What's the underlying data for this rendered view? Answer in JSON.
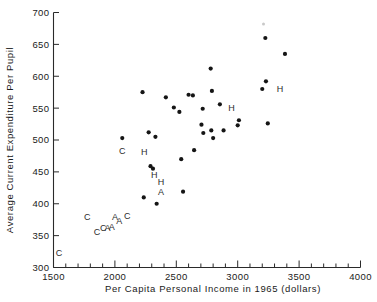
{
  "chart_data": {
    "type": "scatter",
    "title": "",
    "xlabel": "Per Capita Personal Income in 1965 (dollars)",
    "ylabel": "Average Current Expenditure Per Pupil",
    "xlim": [
      1500,
      4000
    ],
    "ylim": [
      300,
      700
    ],
    "xticks": [
      1500,
      2000,
      2500,
      3000,
      3500,
      4000
    ],
    "xtick_labels": [
      "1500",
      "2000",
      "2500",
      "3000",
      "3500",
      "4000"
    ],
    "xminor_step": 100,
    "yticks": [
      300,
      350,
      400,
      450,
      500,
      550,
      600,
      650,
      700
    ],
    "ytick_labels": [
      "300",
      "350",
      "400",
      "450",
      "500",
      "550",
      "600",
      "650",
      "700"
    ],
    "grid": false,
    "legend": "none",
    "marker": "filled-circle",
    "marker_color": "#151515",
    "points": [
      {
        "x": 2060,
        "y": 503
      },
      {
        "x": 2225,
        "y": 575
      },
      {
        "x": 2275,
        "y": 512
      },
      {
        "x": 2290,
        "y": 459
      },
      {
        "x": 2310,
        "y": 455
      },
      {
        "x": 2330,
        "y": 505
      },
      {
        "x": 2235,
        "y": 410
      },
      {
        "x": 2340,
        "y": 400
      },
      {
        "x": 2415,
        "y": 567
      },
      {
        "x": 2480,
        "y": 551
      },
      {
        "x": 2525,
        "y": 544
      },
      {
        "x": 2540,
        "y": 470
      },
      {
        "x": 2555,
        "y": 419
      },
      {
        "x": 2600,
        "y": 571
      },
      {
        "x": 2635,
        "y": 570
      },
      {
        "x": 2645,
        "y": 484
      },
      {
        "x": 2705,
        "y": 524
      },
      {
        "x": 2715,
        "y": 549
      },
      {
        "x": 2720,
        "y": 511
      },
      {
        "x": 2780,
        "y": 612
      },
      {
        "x": 2790,
        "y": 577
      },
      {
        "x": 2785,
        "y": 515
      },
      {
        "x": 2800,
        "y": 503
      },
      {
        "x": 2855,
        "y": 556
      },
      {
        "x": 2885,
        "y": 515
      },
      {
        "x": 3000,
        "y": 523
      },
      {
        "x": 3010,
        "y": 531
      },
      {
        "x": 3200,
        "y": 580
      },
      {
        "x": 3225,
        "y": 660
      },
      {
        "x": 3230,
        "y": 592
      },
      {
        "x": 3245,
        "y": 526
      },
      {
        "x": 3385,
        "y": 635
      }
    ],
    "smudge": {
      "x": 3210,
      "y": 682
    },
    "letter_labels": [
      {
        "text": "C",
        "x": 1545,
        "y": 318
      },
      {
        "text": "C",
        "x": 1775,
        "y": 375
      },
      {
        "text": "C",
        "x": 1855,
        "y": 351
      },
      {
        "text": "C",
        "x": 1905,
        "y": 357
      },
      {
        "text": "A",
        "x": 1940,
        "y": 358
      },
      {
        "text": "A",
        "x": 1975,
        "y": 359
      },
      {
        "text": "A",
        "x": 2000,
        "y": 375
      },
      {
        "text": "A",
        "x": 2035,
        "y": 369
      },
      {
        "text": "C",
        "x": 2100,
        "y": 376
      },
      {
        "text": "C",
        "x": 2060,
        "y": 478
      },
      {
        "text": "H",
        "x": 2240,
        "y": 477
      },
      {
        "text": "H",
        "x": 2320,
        "y": 440
      },
      {
        "text": "H",
        "x": 2375,
        "y": 429
      },
      {
        "text": "A",
        "x": 2375,
        "y": 413
      },
      {
        "text": "H",
        "x": 2950,
        "y": 546
      },
      {
        "text": "H",
        "x": 3345,
        "y": 575
      }
    ]
  }
}
